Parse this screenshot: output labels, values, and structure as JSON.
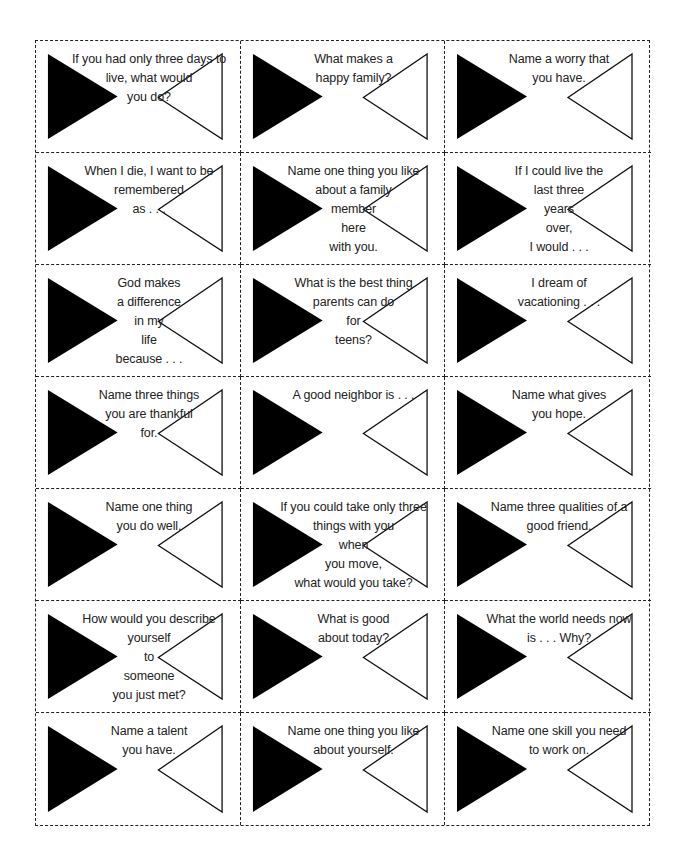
{
  "page": {
    "layout": {
      "columns": 3,
      "rows": 7
    },
    "colors": {
      "border": "#222222",
      "filled_triangle": "#000000",
      "outline_triangle": "#ffffff",
      "text": "#222222"
    }
  },
  "cards": [
    {
      "lines": [
        "If you had only three days to",
        "live, what would",
        "you do?"
      ]
    },
    {
      "lines": [
        "What makes a",
        "happy family?"
      ]
    },
    {
      "lines": [
        "Name a worry that",
        "you have."
      ]
    },
    {
      "lines": [
        "When I die, I want to be",
        "remembered",
        "as  .  .  ."
      ]
    },
    {
      "lines": [
        "Name one thing you like",
        "about a family",
        "member",
        "here",
        "with you."
      ]
    },
    {
      "lines": [
        "If I could live the",
        "last three",
        "years",
        "over,",
        "I would  .  .  ."
      ]
    },
    {
      "lines": [
        "God makes",
        "a difference",
        "in my",
        "life",
        "because  .  .  ."
      ]
    },
    {
      "lines": [
        "What is the best thing",
        "parents can do",
        "for",
        "teens?"
      ]
    },
    {
      "lines": [
        "I dream of",
        "vacationing  .  .  ."
      ]
    },
    {
      "lines": [
        "Name three things",
        "you are thankful",
        "for."
      ]
    },
    {
      "lines": [
        "A good neighbor is  .  .  ."
      ]
    },
    {
      "lines": [
        "Name what gives",
        "you hope."
      ]
    },
    {
      "lines": [
        "Name one thing",
        "you do well."
      ]
    },
    {
      "lines": [
        "If you could take only three",
        "things with you",
        "when",
        "you move,",
        "what would you take?"
      ]
    },
    {
      "lines": [
        "Name three qualities of a",
        "good friend."
      ]
    },
    {
      "lines": [
        "How would you describe",
        "yourself",
        "to",
        "someone",
        "you just met?"
      ]
    },
    {
      "lines": [
        "What is good",
        "about today?"
      ]
    },
    {
      "lines": [
        "What the world needs now",
        "is  .  .  .  Why?"
      ]
    },
    {
      "lines": [
        "Name a talent",
        "you have."
      ]
    },
    {
      "lines": [
        "Name one thing you like",
        "about yourself."
      ]
    },
    {
      "lines": [
        "Name one skill you need",
        "to work on."
      ]
    }
  ]
}
